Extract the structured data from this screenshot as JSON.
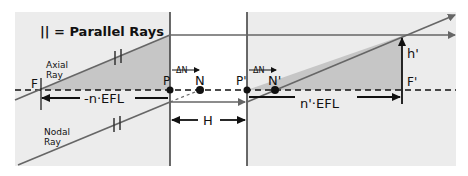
{
  "legend": {
    "text": "|| = Parallel Rays"
  },
  "rays": {
    "axial_label_line1": "Axial",
    "axial_label_line2": "Ray",
    "nodal_label_line1": "Nodal",
    "nodal_label_line2": "Ray",
    "parallel_mark": "||"
  },
  "points": {
    "F": "F",
    "P": "P",
    "N": "N",
    "P_prime": "P'",
    "N_prime": "N'",
    "F_prime": "F'",
    "h_prime": "h'"
  },
  "dimensions": {
    "front_focal": "-n·EFL",
    "rear_focal": "n'·EFL",
    "principal_separation": "H",
    "nodal_shift": "ΔN"
  },
  "colors": {
    "region_fill": "#ededed",
    "triangle_fill": "#c8c8c8",
    "ray": "#666666",
    "line": "#222222"
  }
}
